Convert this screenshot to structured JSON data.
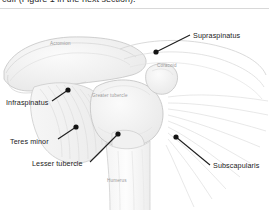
{
  "caption": {
    "text": "cuff (Figure 1 in the next section)."
  },
  "figure": {
    "background": "#ffffff",
    "line_color": "#2b2b2b",
    "bone_fill": "#f2f2f2",
    "bone_stroke": "#c9c9c9",
    "muscle_stroke": "#d2d2d2",
    "shadow": "#e9e9e9"
  },
  "labels": [
    {
      "id": "supraspinatus",
      "text": "Supraspinatus",
      "x": 193,
      "y": 31,
      "dot_x": 156,
      "dot_y": 51,
      "line_to_x": 190,
      "line_to_y": 34
    },
    {
      "id": "infraspinatus",
      "text": "Infraspinatus",
      "x": 6,
      "y": 98,
      "dot_x": 68,
      "dot_y": 89,
      "line_to_x": 52,
      "line_to_y": 100
    },
    {
      "id": "teres-minor",
      "text": "Teres minor",
      "x": 10,
      "y": 137,
      "dot_x": 76,
      "dot_y": 126,
      "line_to_x": 58,
      "line_to_y": 138
    },
    {
      "id": "lesser-tubercle",
      "text": "Lesser tubercle",
      "x": 32,
      "y": 161,
      "dot_x": 118,
      "dot_y": 133,
      "line_to_x": 90,
      "line_to_y": 161
    },
    {
      "id": "subscapularis",
      "text": "Subscapularis",
      "x": 213,
      "y": 163,
      "dot_x": 176,
      "dot_y": 136,
      "line_to_x": 210,
      "line_to_y": 164
    }
  ],
  "small_labels": [
    {
      "id": "acromion",
      "text": "Acromion",
      "x": 50,
      "y": 41
    },
    {
      "id": "coracoid",
      "text": "Coracoid",
      "x": 157,
      "y": 63
    },
    {
      "id": "greater-tubercle",
      "text": "Greater tubercle",
      "x": 92,
      "y": 92
    },
    {
      "id": "humerus",
      "text": "Humerus",
      "x": 107,
      "y": 178
    }
  ]
}
